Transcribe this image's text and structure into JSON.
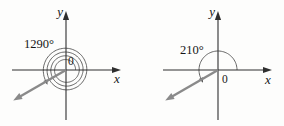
{
  "figure": {
    "colors": {
      "background": "#fdfdfc",
      "axis": "#2e2e2e",
      "curve": "#555555",
      "ray": "#8a8a8a",
      "text": "#161616"
    },
    "axis_labels": {
      "x": "x",
      "y": "y",
      "origin": "0"
    },
    "diagrams": [
      {
        "id": "left",
        "angle_label": "1290°",
        "angle_deg": 1290,
        "kind": "spiral",
        "terminal_direction_deg": 210
      },
      {
        "id": "right",
        "angle_label": "210°",
        "angle_deg": 210,
        "kind": "arc",
        "terminal_direction_deg": 210
      }
    ]
  }
}
